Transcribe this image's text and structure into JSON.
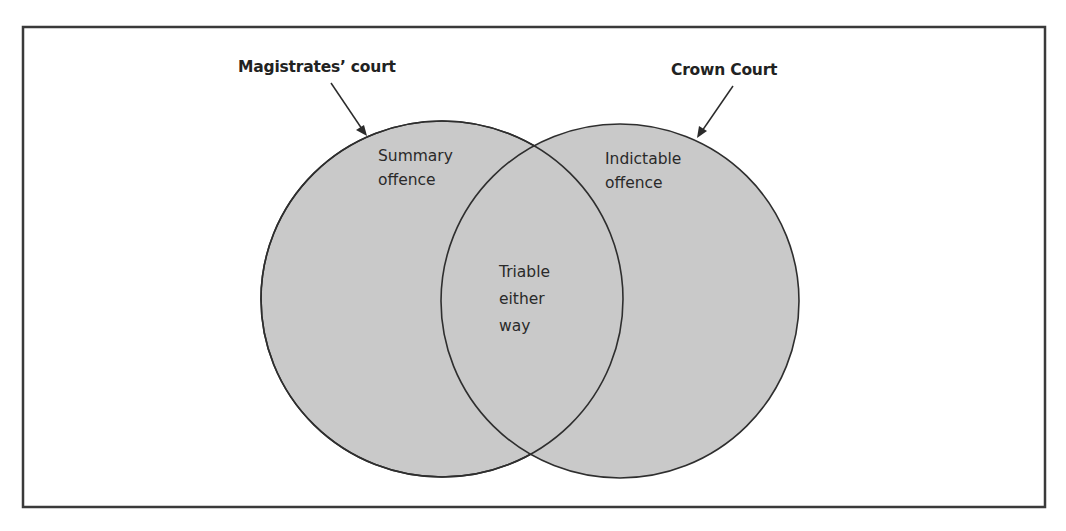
{
  "diagram": {
    "type": "venn",
    "colors": {
      "circle_fill": "#c9c9c9",
      "stroke": "#2e2e2e",
      "frame": "#3a3a3a",
      "background": "#ffffff"
    },
    "sets": [
      {
        "id": "magistrates",
        "court_label": "Magistrates’ court",
        "region_label_lines": [
          "Summary",
          "offence"
        ]
      },
      {
        "id": "crown",
        "court_label": "Crown Court",
        "region_label_lines": [
          "Indictable",
          "offence"
        ]
      }
    ],
    "intersection": {
      "label_lines": [
        "Triable",
        "either",
        "way"
      ]
    }
  }
}
